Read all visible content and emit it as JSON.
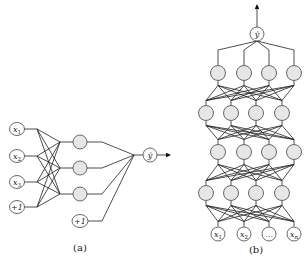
{
  "panel_a": {
    "caption": "(a)",
    "inputs": [
      {
        "label": "x1",
        "x": 17,
        "y": 129
      },
      {
        "label": "x2",
        "x": 17,
        "y": 156
      },
      {
        "label": "x3",
        "x": 17,
        "y": 182
      },
      {
        "label": "+1",
        "x": 17,
        "y": 207
      }
    ],
    "hidden": [
      {
        "x": 80,
        "y": 142
      },
      {
        "x": 80,
        "y": 168
      },
      {
        "x": 80,
        "y": 194
      }
    ],
    "bias_hidden": {
      "label": "+1",
      "x": 80,
      "y": 221
    },
    "output": {
      "label": "ŷ",
      "x": 150,
      "y": 155
    }
  },
  "panel_b": {
    "caption": "(b)",
    "output": {
      "label": "ŷ",
      "x": 257,
      "y": 34
    },
    "rows": [
      {
        "y": 73,
        "xs": [
          218,
          244,
          269,
          294
        ]
      },
      {
        "y": 113,
        "xs": [
          206,
          231,
          256,
          282
        ]
      },
      {
        "y": 152,
        "xs": [
          218,
          244,
          269,
          294
        ]
      },
      {
        "y": 193,
        "xs": [
          206,
          231,
          256,
          282
        ]
      }
    ],
    "inputs": [
      {
        "label": "x1",
        "x": 218,
        "y": 234
      },
      {
        "label": "x2",
        "x": 244,
        "y": 234
      },
      {
        "label": "…",
        "x": 269,
        "y": 234
      },
      {
        "label": "xn",
        "x": 294,
        "y": 234
      }
    ]
  }
}
